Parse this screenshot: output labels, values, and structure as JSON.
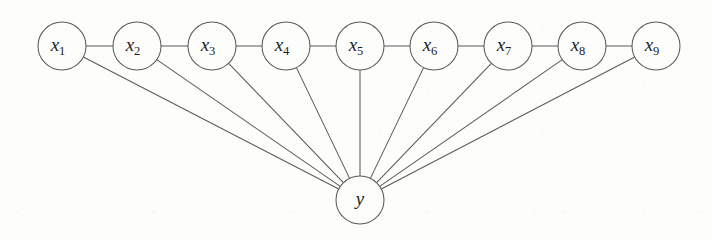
{
  "figure": {
    "kind": "probabilistic-graphical-model",
    "width": 712,
    "height": 240,
    "background_color": "#fdfdfc",
    "stroke_color": "#5b5b5b",
    "label_color": "#1d1d1d",
    "node_radius": 24,
    "edge_width": 1.05
  },
  "nodes": [
    {
      "id": "x1",
      "symbol": "x",
      "subscript": "1",
      "label": "x1",
      "cx": 62,
      "cy": 46,
      "r": 24,
      "role": "observation"
    },
    {
      "id": "x2",
      "symbol": "x",
      "subscript": "2",
      "label": "x2",
      "cx": 137,
      "cy": 46,
      "r": 24,
      "role": "observation"
    },
    {
      "id": "x3",
      "symbol": "x",
      "subscript": "3",
      "label": "x3",
      "cx": 212,
      "cy": 46,
      "r": 24,
      "role": "observation"
    },
    {
      "id": "x4",
      "symbol": "x",
      "subscript": "4",
      "label": "x4",
      "cx": 286,
      "cy": 46,
      "r": 24,
      "role": "observation"
    },
    {
      "id": "x5",
      "symbol": "x",
      "subscript": "5",
      "label": "x5",
      "cx": 360,
      "cy": 46,
      "r": 24,
      "role": "observation"
    },
    {
      "id": "x6",
      "symbol": "x",
      "subscript": "6",
      "label": "x6",
      "cx": 434,
      "cy": 46,
      "r": 24,
      "role": "observation"
    },
    {
      "id": "x7",
      "symbol": "x",
      "subscript": "7",
      "label": "x7",
      "cx": 508,
      "cy": 46,
      "r": 24,
      "role": "observation"
    },
    {
      "id": "x8",
      "symbol": "x",
      "subscript": "8",
      "label": "x8",
      "cx": 582,
      "cy": 46,
      "r": 24,
      "role": "observation"
    },
    {
      "id": "x9",
      "symbol": "x",
      "subscript": "9",
      "label": "x9",
      "cx": 656,
      "cy": 46,
      "r": 24,
      "role": "observation"
    },
    {
      "id": "y",
      "symbol": "y",
      "subscript": "",
      "label": "y",
      "cx": 360,
      "cy": 200,
      "r": 24,
      "role": "label"
    }
  ],
  "edges": [
    {
      "id": "edge-x1-x2",
      "from": "x1",
      "to": "x2",
      "type": "chain"
    },
    {
      "id": "edge-x2-x3",
      "from": "x2",
      "to": "x3",
      "type": "chain"
    },
    {
      "id": "edge-x3-x4",
      "from": "x3",
      "to": "x4",
      "type": "chain"
    },
    {
      "id": "edge-x4-x5",
      "from": "x4",
      "to": "x5",
      "type": "chain"
    },
    {
      "id": "edge-x5-x6",
      "from": "x5",
      "to": "x6",
      "type": "chain"
    },
    {
      "id": "edge-x6-x7",
      "from": "x6",
      "to": "x7",
      "type": "chain"
    },
    {
      "id": "edge-x7-x8",
      "from": "x7",
      "to": "x8",
      "type": "chain"
    },
    {
      "id": "edge-x8-x9",
      "from": "x8",
      "to": "x9",
      "type": "chain"
    },
    {
      "id": "edge-x1-y",
      "from": "x1",
      "to": "y",
      "type": "fan"
    },
    {
      "id": "edge-x2-y",
      "from": "x2",
      "to": "y",
      "type": "fan"
    },
    {
      "id": "edge-x3-y",
      "from": "x3",
      "to": "y",
      "type": "fan"
    },
    {
      "id": "edge-x4-y",
      "from": "x4",
      "to": "y",
      "type": "fan"
    },
    {
      "id": "edge-x5-y",
      "from": "x5",
      "to": "y",
      "type": "fan"
    },
    {
      "id": "edge-x6-y",
      "from": "x6",
      "to": "y",
      "type": "fan"
    },
    {
      "id": "edge-x7-y",
      "from": "x7",
      "to": "y",
      "type": "fan"
    },
    {
      "id": "edge-x8-y",
      "from": "x8",
      "to": "y",
      "type": "fan"
    },
    {
      "id": "edge-x9-y",
      "from": "x9",
      "to": "y",
      "type": "fan"
    }
  ]
}
